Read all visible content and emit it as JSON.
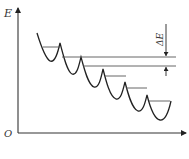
{
  "diagram": {
    "type": "energy-level-diagram",
    "y_axis_label": "E",
    "origin_label": "O",
    "delta_label": "ΔE",
    "colors": {
      "line": "#222222",
      "level": "#555555",
      "axis": "#333333"
    },
    "well_count": 6,
    "annotations": [
      "E",
      "O",
      "ΔE"
    ]
  }
}
